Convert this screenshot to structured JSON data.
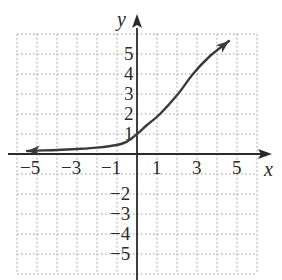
{
  "chart_data": {
    "type": "line",
    "title": "",
    "xlabel": "x",
    "ylabel": "y",
    "xlim": [
      -6,
      6
    ],
    "ylim": [
      -6,
      6
    ],
    "grid": true,
    "x_ticks": [
      "−5",
      "−3",
      "−1",
      "1",
      "3",
      "5"
    ],
    "y_ticks_pos": [
      "1",
      "2",
      "3",
      "4",
      "5"
    ],
    "y_ticks_neg": [
      "−2",
      "−3",
      "−4",
      "−5"
    ],
    "series": [
      {
        "name": "curve",
        "arrows": "both ends",
        "x": [
          -5.5,
          -5,
          -4,
          -3,
          -2,
          -1,
          -0.5,
          0,
          0.5,
          1.15,
          2.05,
          2.8,
          3.6,
          4.6
        ],
        "y": [
          0.15,
          0.17,
          0.2,
          0.25,
          0.32,
          0.45,
          0.62,
          1.0,
          1.45,
          2.0,
          3.0,
          4.0,
          4.85,
          5.65
        ]
      }
    ]
  },
  "labels": {
    "x_axis": "x",
    "y_axis": "y",
    "xt": [
      "−5",
      "−3",
      "−1",
      "1",
      "3",
      "5"
    ],
    "yt": [
      "5",
      "4",
      "3",
      "2",
      "1",
      "−2",
      "−3",
      "−4",
      "−5"
    ]
  }
}
